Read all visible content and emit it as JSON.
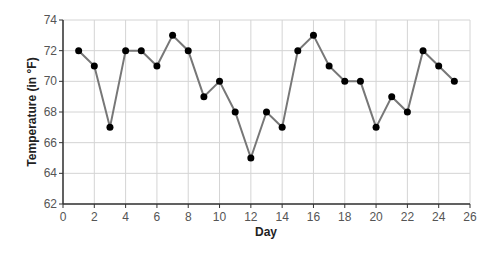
{
  "chart_data": {
    "type": "line",
    "title": "",
    "xlabel": "Day",
    "ylabel": "Temperature (in °F)",
    "xlim": [
      0,
      26
    ],
    "ylim": [
      62,
      74
    ],
    "xticks": [
      0,
      2,
      4,
      6,
      8,
      10,
      12,
      14,
      16,
      18,
      20,
      22,
      24,
      26
    ],
    "yticks": [
      62,
      64,
      66,
      68,
      70,
      72,
      74
    ],
    "grid": true,
    "legend": null,
    "series": [
      {
        "name": "Temperature",
        "color": "#777777",
        "marker_color": "#000000",
        "x": [
          1,
          2,
          3,
          4,
          5,
          6,
          7,
          8,
          9,
          10,
          11,
          12,
          13,
          14,
          15,
          16,
          17,
          18,
          19,
          20,
          21,
          22,
          23,
          24,
          25
        ],
        "values": [
          72,
          71,
          67,
          72,
          72,
          71,
          73,
          72,
          69,
          70,
          68,
          65,
          68,
          67,
          72,
          73,
          71,
          70,
          70,
          67,
          69,
          68,
          72,
          71,
          70
        ]
      }
    ]
  }
}
